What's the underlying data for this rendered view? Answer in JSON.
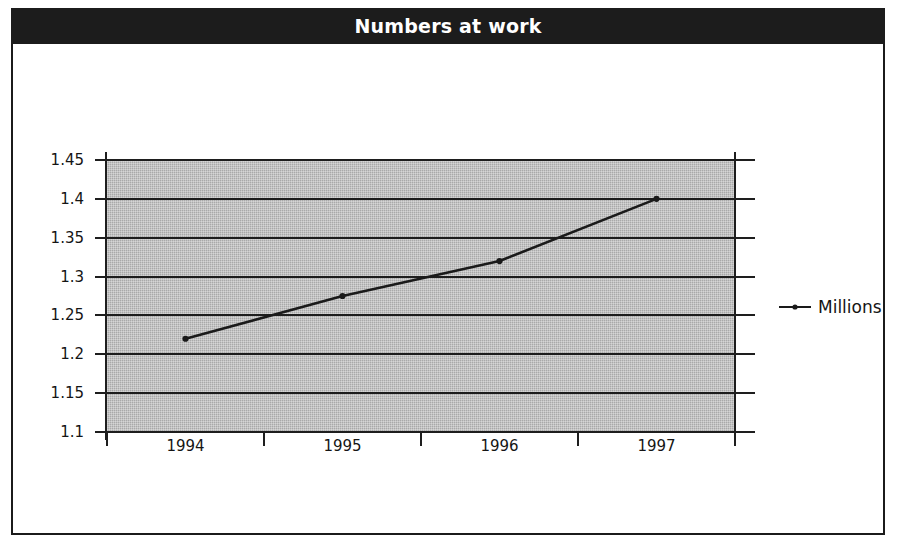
{
  "chart_data": {
    "type": "line",
    "title": "Numbers at work",
    "xlabel": "",
    "ylabel": "",
    "categories": [
      "1994",
      "1995",
      "1996",
      "1997"
    ],
    "series": [
      {
        "name": "Millions",
        "values": [
          1.22,
          1.275,
          1.32,
          1.4
        ]
      }
    ],
    "ylim": [
      1.1,
      1.45
    ],
    "ytick_labels": [
      "1.45",
      "1.4",
      "1.35",
      "1.3",
      "1.25",
      "1.2",
      "1.15",
      "1.1"
    ],
    "ytick_values": [
      1.45,
      1.4,
      1.35,
      1.3,
      1.25,
      1.2,
      1.15,
      1.1
    ],
    "grid": "horizontal",
    "legend_position": "right",
    "plot_background_color": "#a9a9a9",
    "line_color": "#1a1a1a",
    "marker": "round",
    "title_banner_color": "#1c1c1c",
    "title_text_color": "#ffffff"
  },
  "legend": {
    "entries": [
      {
        "label": "Millions",
        "symbol": "line-marker-icon"
      }
    ]
  },
  "frame": {
    "border_color": "#1b1b1b"
  }
}
